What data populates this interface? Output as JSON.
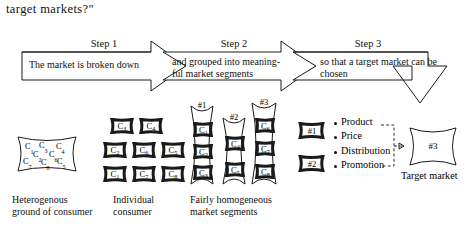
{
  "document": {
    "title_fragment": "target markets?\""
  },
  "steps": [
    {
      "label": "Step 1",
      "body_lines": [
        "The market is broken down"
      ]
    },
    {
      "label": "Step 2",
      "body_lines": [
        "and grouped into meaning-",
        "ful market segments"
      ]
    },
    {
      "label": "Step 3",
      "body_lines": [
        "so that a target market can be",
        "chosen"
      ]
    }
  ],
  "heterogeneous_group": {
    "caption_lines": [
      "Heterogenous",
      "ground of consumer"
    ],
    "members": [
      {
        "id": "C",
        "sub": "1"
      },
      {
        "id": "C",
        "sub": "3"
      },
      {
        "id": "C",
        "sub": "4"
      },
      {
        "id": "C",
        "sub": "2"
      },
      {
        "id": "C",
        "sub": "6"
      },
      {
        "id": "C",
        "sub": "7"
      },
      {
        "id": "C",
        "sub": "8"
      },
      {
        "id": "C",
        "sub": "5"
      }
    ]
  },
  "individual_consumers": {
    "caption_lines": [
      "Individual",
      "consumer"
    ],
    "rows": [
      [
        {
          "id": "C",
          "sub": "3"
        },
        {
          "id": "C",
          "sub": "4"
        }
      ],
      [
        {
          "id": "C",
          "sub": "2"
        },
        {
          "id": "C",
          "sub": "6"
        },
        {
          "id": "C",
          "sub": "5"
        }
      ],
      [
        {
          "id": "C",
          "sub": "1"
        },
        {
          "id": "C",
          "sub": "7"
        },
        {
          "id": "C",
          "sub": "8"
        }
      ]
    ]
  },
  "market_segments": {
    "caption_lines": [
      "Fairly homogeneous",
      "market segments"
    ],
    "segments": [
      {
        "number": "#1",
        "members": [
          {
            "id": "C",
            "sub": "1"
          },
          {
            "id": "C",
            "sub": "2"
          },
          {
            "id": "C",
            "sub": "3"
          }
        ]
      },
      {
        "number": "#2",
        "members": [
          {
            "id": "C",
            "sub": "4"
          },
          {
            "id": "C",
            "sub": "5"
          }
        ]
      },
      {
        "number": "#3",
        "members": [
          {
            "id": "C",
            "sub": "6"
          },
          {
            "id": "C",
            "sub": "7"
          },
          {
            "id": "C",
            "sub": "8"
          }
        ]
      }
    ]
  },
  "rejected_segments": [
    {
      "number": "#1"
    },
    {
      "number": "#2"
    }
  ],
  "marketing_mix": {
    "items": [
      "Product",
      "Price",
      "Distribution",
      "Promotion"
    ]
  },
  "target_market": {
    "number": "#3",
    "caption": "Target market"
  },
  "colors": {
    "stroke": "#1a1a1a",
    "cell_fill": "#d9d9d9",
    "background": "#ffffff"
  }
}
